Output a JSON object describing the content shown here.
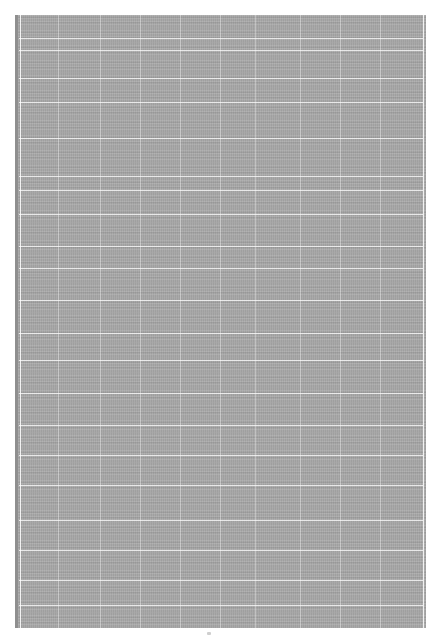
{
  "document": {
    "type": "scanned-page",
    "legible_text": "",
    "page_mark": "",
    "scan_block": {
      "fill_color": "#a9a9a9",
      "border_color": "#8f8f8f",
      "grid_line_color": "#ffffff",
      "horizontal_lines_y": [
        23,
        35,
        63,
        87,
        123,
        161,
        175,
        199,
        231,
        253,
        285,
        318,
        345,
        378,
        410,
        440,
        470,
        505,
        535,
        565,
        590
      ],
      "vertical_lines_x": [
        5,
        43,
        85,
        125,
        165,
        205,
        240,
        285,
        325,
        365,
        408
      ]
    }
  }
}
